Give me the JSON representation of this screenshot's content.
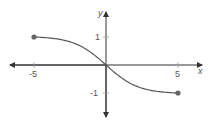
{
  "chart_data": {
    "type": "line",
    "title": "",
    "xlabel": "x",
    "ylabel": "y",
    "xlim": [
      -6.5,
      6.5
    ],
    "ylim": [
      -1.6,
      1.6
    ],
    "grid": false,
    "x_ticks": [
      -5,
      5
    ],
    "y_ticks": [
      1,
      -1
    ],
    "x_tick_labels": [
      "-5",
      "5"
    ],
    "y_tick_labels": [
      "1",
      "-1"
    ],
    "series": [
      {
        "name": "f(x)",
        "x": [
          -5,
          -4,
          -3,
          -2,
          -1,
          0,
          1,
          2,
          3,
          4,
          5
        ],
        "y": [
          1,
          0.96,
          0.88,
          0.72,
          0.42,
          0,
          -0.42,
          -0.72,
          -0.88,
          -0.96,
          -1
        ],
        "endpoints": [
          {
            "x": -5,
            "y": 1,
            "closed": true
          },
          {
            "x": 5,
            "y": -1,
            "closed": true
          }
        ]
      }
    ],
    "colors": {
      "axis": "#333333",
      "curve": "#555555",
      "points": "#666666"
    }
  },
  "labels": {
    "x_axis": "x",
    "y_axis": "y",
    "tick_neg5": "-5",
    "tick_5": "5",
    "tick_1": "1",
    "tick_neg1": "-1"
  }
}
